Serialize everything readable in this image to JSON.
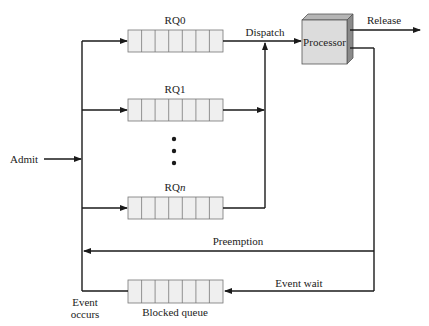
{
  "diagram": {
    "type": "scheduling-queue-diagram",
    "labels": {
      "admit": "Admit",
      "dispatch": "Dispatch",
      "release": "Release",
      "processor": "Processor",
      "preemption": "Preemption",
      "event_wait": "Event wait",
      "event_occurs_line1": "Event",
      "event_occurs_line2": "occurs",
      "blocked_queue": "Blocked queue",
      "ellipsis": "•"
    },
    "ready_queues": [
      {
        "id": "rq0",
        "label": "RQ0",
        "cells": 7
      },
      {
        "id": "rq1",
        "label": "RQ1",
        "cells": 7
      },
      {
        "id": "rqn",
        "label_prefix": "RQ",
        "label_suffix": "n",
        "cells": 7
      }
    ],
    "blocked_queue": {
      "cells": 7
    },
    "colors": {
      "line": "#1a1a1a",
      "queue_fill": "#efefef",
      "processor_front": "#dcdcdc",
      "processor_side": "#8a8a8a",
      "processor_top": "#b5b5b5"
    }
  }
}
